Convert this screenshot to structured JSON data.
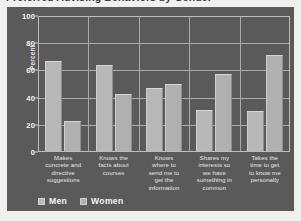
{
  "title": {
    "clipped_text": "Preferred Advising Behaviors by Gender"
  },
  "legend": {
    "position": "bottom-left",
    "items": [
      {
        "label": "Men",
        "color": "#b8b8b8"
      },
      {
        "label": "Women",
        "color": "#b0b0b0"
      }
    ]
  },
  "axes": {
    "ylabel": "Percent",
    "yticks": [
      "0",
      "20",
      "40",
      "60",
      "80",
      "100"
    ]
  },
  "chart_data": {
    "type": "bar",
    "title": "",
    "xlabel": "",
    "ylabel": "Percent",
    "ylim": [
      0,
      100
    ],
    "grid": true,
    "legend_position": "bottom-left",
    "categories": [
      "Makes concrete and directive suggestions",
      "Knows the facts about courses",
      "Knows where to send me to get the information",
      "Shares my interests so we have something in common",
      "Takes the time to get to know me personally"
    ],
    "category_lines": [
      [
        "Makes",
        "concrete and",
        "directive",
        "suggestions"
      ],
      [
        "Knows the",
        "facts about",
        "courses"
      ],
      [
        "Knows",
        "where to",
        "send me to",
        "get the",
        "information"
      ],
      [
        "Shares my",
        "interests so",
        "we have",
        "something in",
        "common"
      ],
      [
        "Takes the",
        "time to get",
        "to know me",
        "personally"
      ]
    ],
    "series": [
      {
        "name": "Men",
        "values": [
          67,
          64,
          47,
          31,
          30
        ]
      },
      {
        "name": "Women",
        "values": [
          23,
          43,
          50,
          57,
          71
        ]
      }
    ]
  },
  "colors": {
    "panel_background": "#5a5a5a",
    "page_background": "#f2f0ee",
    "gridline": "#a9a9a9",
    "text": "#f2f2f2"
  }
}
